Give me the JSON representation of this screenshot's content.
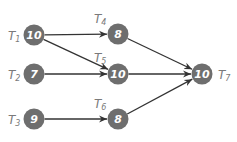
{
  "diagram": {
    "type": "task-dependency-graph",
    "colors": {
      "node_fill": "#6e6e6e",
      "node_text": "#ffffff",
      "edge": "#333333",
      "label": "#7a7a7a"
    },
    "nodes": [
      {
        "id": "T1",
        "label_main": "T",
        "label_sub": "1",
        "weight": "10",
        "cx": 34,
        "cy": 35,
        "lx": 8,
        "ly": 40,
        "label_side": "left"
      },
      {
        "id": "T2",
        "label_main": "T",
        "label_sub": "2",
        "weight": "7",
        "cx": 34,
        "cy": 74,
        "lx": 8,
        "ly": 79,
        "label_side": "left"
      },
      {
        "id": "T3",
        "label_main": "T",
        "label_sub": "3",
        "weight": "9",
        "cx": 34,
        "cy": 119,
        "lx": 8,
        "ly": 124,
        "label_side": "left"
      },
      {
        "id": "T4",
        "label_main": "T",
        "label_sub": "4",
        "weight": "8",
        "cx": 118,
        "cy": 34,
        "lx": 94,
        "ly": 23,
        "label_side": "top"
      },
      {
        "id": "T5",
        "label_main": "T",
        "label_sub": "5",
        "weight": "10",
        "cx": 118,
        "cy": 74,
        "lx": 94,
        "ly": 62,
        "label_side": "top"
      },
      {
        "id": "T6",
        "label_main": "T",
        "label_sub": "6",
        "weight": "8",
        "cx": 118,
        "cy": 119,
        "lx": 94,
        "ly": 108,
        "label_side": "top"
      },
      {
        "id": "T7",
        "label_main": "T",
        "label_sub": "7",
        "weight": "10",
        "cx": 202,
        "cy": 74,
        "lx": 218,
        "ly": 79,
        "label_side": "right"
      }
    ],
    "edges": [
      {
        "from": "T1",
        "to": "T4"
      },
      {
        "from": "T1",
        "to": "T5"
      },
      {
        "from": "T2",
        "to": "T5"
      },
      {
        "from": "T3",
        "to": "T6"
      },
      {
        "from": "T4",
        "to": "T7"
      },
      {
        "from": "T5",
        "to": "T7"
      },
      {
        "from": "T6",
        "to": "T7"
      }
    ]
  }
}
